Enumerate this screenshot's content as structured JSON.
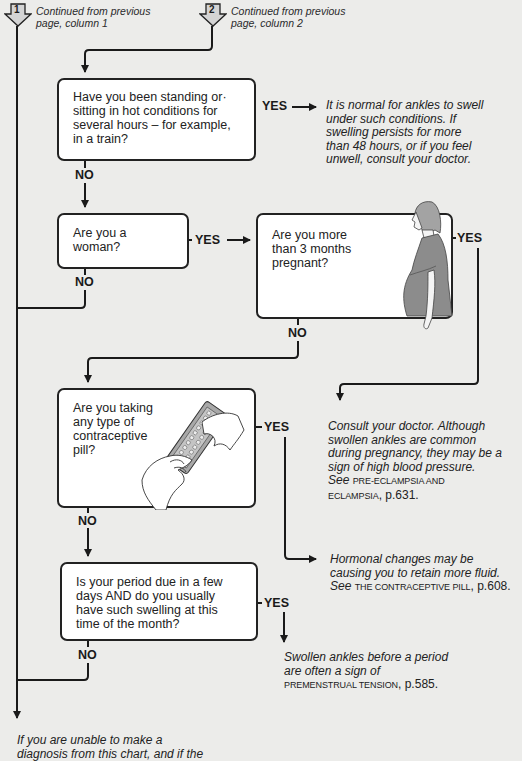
{
  "continuations": [
    {
      "number": "1",
      "text_line1": "Continued from previous",
      "text_line2": "page, column 1"
    },
    {
      "number": "2",
      "text_line1": "Continued from previous",
      "text_line2": "page, column 2"
    }
  ],
  "labels": {
    "yes": "YES",
    "no": "NO"
  },
  "questions": [
    {
      "id": "q1",
      "lines": [
        "Have you been standing or·",
        "sitting in hot conditions for",
        "several hours – for example,",
        "in a train?"
      ]
    },
    {
      "id": "q2",
      "lines": [
        "Are you a",
        "woman?"
      ]
    },
    {
      "id": "q3",
      "lines": [
        "Are you more",
        "than 3 months",
        "pregnant?"
      ],
      "illustration": "pregnant-woman"
    },
    {
      "id": "q4",
      "lines": [
        "Are you taking",
        "any type of",
        "contraceptive",
        "pill?"
      ],
      "illustration": "hands-holding-pill-pack"
    },
    {
      "id": "q5",
      "lines": [
        "Is your period due in a few",
        "days AND do you usually",
        "have such swelling at this",
        "time of the month?"
      ]
    }
  ],
  "answers": {
    "a1": {
      "lines": [
        "It is normal for ankles to swell",
        "under such conditions. If",
        "swelling persists for more",
        "than 48 hours, or if you feel",
        "unwell, consult your doctor."
      ]
    },
    "a3": {
      "lines": [
        "Consult your doctor. Although",
        "swollen ankles are common",
        "during pregnancy, they may be a",
        "sign of high blood pressure."
      ],
      "see": "See",
      "ref_line1": "PRE-ECLAMPSIA AND",
      "ref_line2": "ECLAMPSIA",
      "page": ", p.631."
    },
    "a4": {
      "lines": [
        "Hormonal changes may be",
        "causing you to retain more fluid."
      ],
      "see": "See",
      "ref": "THE CONTRACEPTIVE PILL",
      "page": ", p.608."
    },
    "a5": {
      "lines": [
        "Swollen ankles before a period",
        "are often a sign of"
      ],
      "ref": "PREMENSTRUAL TENSION",
      "page": ", p.585."
    },
    "final": {
      "line1": "If you are unable to make a",
      "line2_partial": "diagnosis from this chart, and if the"
    }
  },
  "colors": {
    "background": "#ececea",
    "line": "#1a1a1a",
    "box": "#ffffff",
    "tab_fill": "#cfcfcf",
    "illustration_gray": "#8c8c8c"
  }
}
